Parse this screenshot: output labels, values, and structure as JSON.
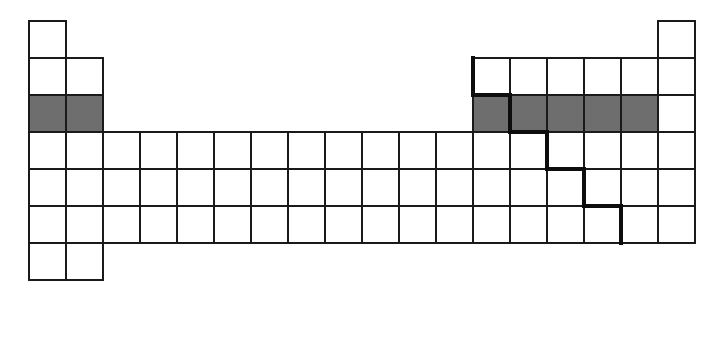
{
  "diagram": {
    "title": "Blank periodic table grid with shaded period-3 elements and metalloid staircase",
    "type": "periodic-table-grid",
    "background_color": "#ffffff",
    "cell_fill_color": "#ffffff",
    "cell_border_color": "#1a1a1a",
    "shaded_fill_color": "#6e6e6e",
    "staircase_color": "#0d0d0d",
    "group_count": 18,
    "period_count": 7,
    "cell_size_px": 37,
    "origin_x_px": 28,
    "origin_y_px": 20,
    "border_width_px": 2,
    "staircase_width_px": 4
  },
  "grid": {
    "groups": [
      1,
      2,
      3,
      4,
      5,
      6,
      7,
      8,
      9,
      10,
      11,
      12,
      13,
      14,
      15,
      16,
      17,
      18
    ],
    "periods": [
      1,
      2,
      3,
      4,
      5,
      6,
      7
    ],
    "rows": [
      {
        "period": 1,
        "occupied_groups": [
          1,
          18
        ],
        "shaded_groups": []
      },
      {
        "period": 2,
        "occupied_groups": [
          1,
          2,
          13,
          14,
          15,
          16,
          17,
          18
        ],
        "shaded_groups": []
      },
      {
        "period": 3,
        "occupied_groups": [
          1,
          2,
          13,
          14,
          15,
          16,
          17,
          18
        ],
        "shaded_groups": [
          1,
          2,
          13,
          14,
          15,
          16,
          17
        ]
      },
      {
        "period": 4,
        "occupied_groups": [
          1,
          2,
          3,
          4,
          5,
          6,
          7,
          8,
          9,
          10,
          11,
          12,
          13,
          14,
          15,
          16,
          17,
          18
        ],
        "shaded_groups": []
      },
      {
        "period": 5,
        "occupied_groups": [
          1,
          2,
          3,
          4,
          5,
          6,
          7,
          8,
          9,
          10,
          11,
          12,
          13,
          14,
          15,
          16,
          17,
          18
        ],
        "shaded_groups": []
      },
      {
        "period": 6,
        "occupied_groups": [
          1,
          2,
          3,
          4,
          5,
          6,
          7,
          8,
          9,
          10,
          11,
          12,
          13,
          14,
          15,
          16,
          17,
          18
        ],
        "shaded_groups": []
      },
      {
        "period": 7,
        "occupied_groups": [
          1,
          2
        ],
        "shaded_groups": []
      }
    ]
  },
  "staircase": {
    "label": "metalloid dividing line",
    "segments": [
      {
        "orientation": "vertical",
        "group_edge": 13,
        "period_start": 2,
        "period_end": 3
      },
      {
        "orientation": "horizontal",
        "period_edge": 3,
        "group_start": 13,
        "group_end": 14
      },
      {
        "orientation": "vertical",
        "group_edge": 14,
        "period_start": 3,
        "period_end": 4
      },
      {
        "orientation": "horizontal",
        "period_edge": 4,
        "group_start": 14,
        "group_end": 15
      },
      {
        "orientation": "vertical",
        "group_edge": 15,
        "period_start": 4,
        "period_end": 5
      },
      {
        "orientation": "horizontal",
        "period_edge": 5,
        "group_start": 15,
        "group_end": 16
      },
      {
        "orientation": "vertical",
        "group_edge": 16,
        "period_start": 5,
        "period_end": 6
      },
      {
        "orientation": "horizontal",
        "period_edge": 6,
        "group_start": 16,
        "group_end": 17
      },
      {
        "orientation": "vertical",
        "group_edge": 17,
        "period_start": 6,
        "period_end": 7
      }
    ]
  }
}
